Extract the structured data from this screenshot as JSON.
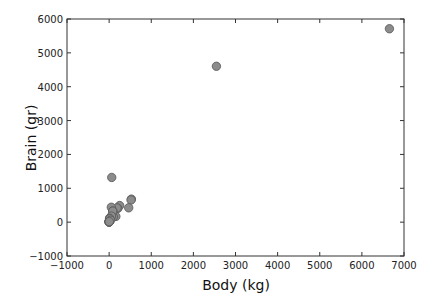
{
  "chart_data": {
    "type": "scatter",
    "title": "",
    "xlabel": "Body (kg)",
    "ylabel": "Brain (gr)",
    "xlim": [
      -1000,
      7000
    ],
    "ylim": [
      -1000,
      6000
    ],
    "xticks": [
      -1000,
      0,
      1000,
      2000,
      3000,
      4000,
      5000,
      6000,
      7000
    ],
    "yticks": [
      -1000,
      0,
      1000,
      2000,
      3000,
      4000,
      5000,
      6000
    ],
    "grid": false,
    "legend": null,
    "marker": {
      "shape": "circle",
      "fill": "#8c8c8c",
      "edge": "#555555",
      "radius": 4.2
    },
    "points": [
      {
        "x": 6654,
        "y": 5712
      },
      {
        "x": 2547,
        "y": 4603
      },
      {
        "x": 62,
        "y": 1320
      },
      {
        "x": 529,
        "y": 680
      },
      {
        "x": 521,
        "y": 655
      },
      {
        "x": 465,
        "y": 423
      },
      {
        "x": 250,
        "y": 490
      },
      {
        "x": 207,
        "y": 406
      },
      {
        "x": 187,
        "y": 419
      },
      {
        "x": 52,
        "y": 440
      },
      {
        "x": 160,
        "y": 169
      },
      {
        "x": 100,
        "y": 157
      },
      {
        "x": 87,
        "y": 325
      },
      {
        "x": 85,
        "y": 325
      },
      {
        "x": 36,
        "y": 119
      },
      {
        "x": 27,
        "y": 115
      },
      {
        "x": 55,
        "y": 180
      },
      {
        "x": 10,
        "y": 115
      },
      {
        "x": 6,
        "y": 50
      },
      {
        "x": 4,
        "y": 25
      },
      {
        "x": 3,
        "y": 12
      },
      {
        "x": 1,
        "y": 6
      },
      {
        "x": 0.5,
        "y": 3
      },
      {
        "x": 0.1,
        "y": 1
      },
      {
        "x": 14,
        "y": 98
      },
      {
        "x": 35,
        "y": 56
      },
      {
        "x": 4,
        "y": 17
      }
    ]
  }
}
